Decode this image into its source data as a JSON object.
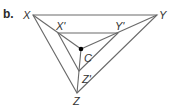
{
  "part_label": "b.",
  "labels": {
    "X": "X",
    "Y": "Y",
    "Z": "Z",
    "Xp": "X'",
    "Yp": "Y'",
    "Zp": "Z'",
    "C": "C"
  },
  "colors": {
    "line": "#6a6a6a",
    "point": "#000000",
    "text": "#333333"
  },
  "points": {
    "X": [
      33,
      15
    ],
    "Y": [
      157,
      15
    ],
    "Z": [
      77,
      93
    ],
    "Xp": [
      58,
      33
    ],
    "Yp": [
      118,
      33
    ],
    "Zp": [
      79,
      71
    ],
    "C": [
      81,
      49
    ]
  }
}
